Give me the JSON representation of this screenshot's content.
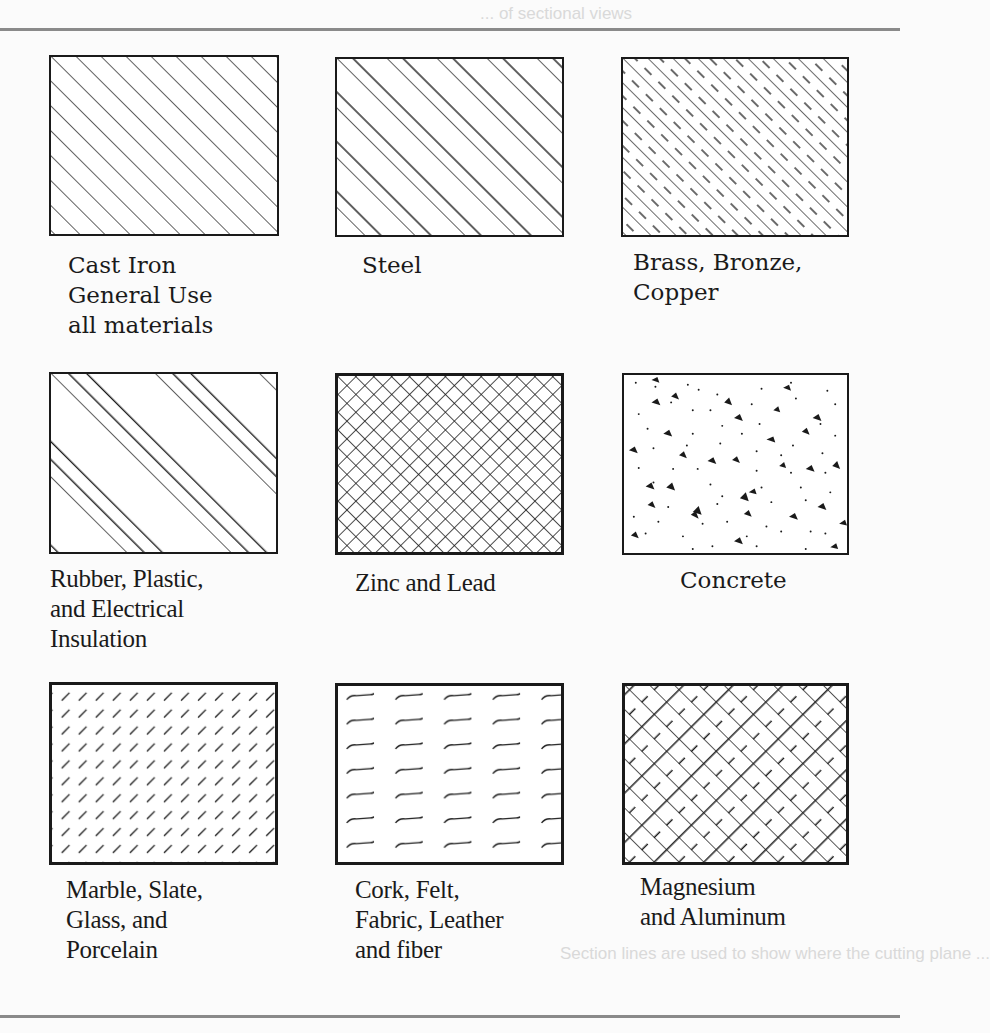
{
  "figure": {
    "background_text": [
      "... of sectional views",
      "Section lines are used to show where the cutting plane ...",
      "Section lines are used to indicate the surface of a cutting plane and to indicate the type of material used."
    ],
    "materials": [
      {
        "id": "cast-iron",
        "pattern": "uniform-diagonal",
        "lines": [
          "Cast Iron",
          "General Use",
          "all materials"
        ]
      },
      {
        "id": "steel",
        "pattern": "paired-diagonal",
        "lines": [
          "Steel"
        ]
      },
      {
        "id": "brass",
        "pattern": "diagonal-alternating-dashed",
        "lines": [
          "Brass, Bronze,",
          "Copper"
        ]
      },
      {
        "id": "rubber",
        "pattern": "grouped-triple-diagonal",
        "lines": [
          "Rubber, Plastic,",
          "and Electrical",
          "Insulation"
        ]
      },
      {
        "id": "zinc",
        "pattern": "crosshatch",
        "lines": [
          "Zinc and Lead"
        ]
      },
      {
        "id": "concrete",
        "pattern": "stipple-aggregate",
        "lines": [
          "Concrete"
        ]
      },
      {
        "id": "marble",
        "pattern": "short-dash-diagonal",
        "lines": [
          "Marble, Slate,",
          "Glass, and",
          "Porcelain"
        ]
      },
      {
        "id": "cork",
        "pattern": "wavy-dashes",
        "lines": [
          "Cork, Felt,",
          "Fabric, Leather",
          "and fiber"
        ]
      },
      {
        "id": "magnesium",
        "pattern": "brick-crosshatch",
        "lines": [
          "Magnesium",
          "and Aluminum"
        ]
      }
    ]
  }
}
